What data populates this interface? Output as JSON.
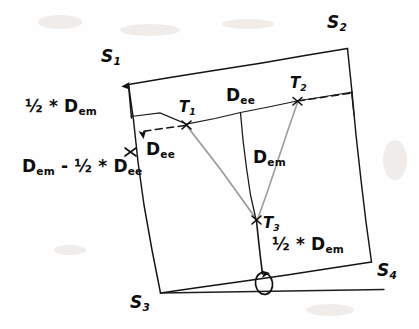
{
  "figure": {
    "type": "geometry-diagram",
    "background_color": "#fefefe",
    "ink_color": "#111111",
    "faint_ink_color": "#8f8f8f"
  },
  "corners": {
    "s1": "S1",
    "s1_base": "S",
    "s1_sub": "1",
    "s2_base": "S",
    "s2_sub": "2",
    "s3_base": "S",
    "s3_sub": "3",
    "s4_base": "S",
    "s4_sub": "4"
  },
  "targets": {
    "t1_base": "T",
    "t1_sub": "1",
    "t2_base": "T",
    "t2_sub": "2",
    "t3_base": "T",
    "t3_sub": "3"
  },
  "annotations": {
    "half_dem_left": "½ * D",
    "half_dem_left_sub": "em",
    "dem_minus_half_dee_a": "D",
    "dem_minus_half_dee_a_sub": "em",
    "dem_minus_half_dee_b": "- ½ * D",
    "dem_minus_half_dee_b_sub": "ee",
    "dee_top": "D",
    "dee_top_sub": "ee",
    "dee_left": "D",
    "dee_left_sub": "ee",
    "dem_center": "D",
    "dem_center_sub": "em",
    "half_dem_bottom": "½ * D",
    "half_dem_bottom_sub": "em",
    "theta": "θ"
  },
  "geometry": {
    "quad": {
      "s1": [
        128,
        84
      ],
      "s2": [
        347,
        48
      ],
      "s4": [
        371,
        262
      ],
      "s3": [
        160,
        293
      ]
    },
    "upper_line": {
      "left": [
        131,
        116
      ],
      "right": [
        352,
        92
      ]
    },
    "nodes": {
      "t1": [
        186,
        124
      ],
      "t2": [
        297,
        101
      ],
      "t3": [
        257,
        220
      ],
      "dee_mid": [
        240,
        112
      ],
      "theta_vertex": [
        263,
        283
      ]
    },
    "reference_line": {
      "from": [
        160,
        293
      ],
      "to": [
        383,
        289
      ]
    }
  }
}
